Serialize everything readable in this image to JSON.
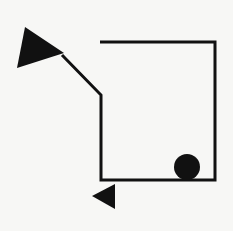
{
  "diagram": {
    "background": "#f7f7f5",
    "stroke_color": "#111111",
    "stroke_width": 3,
    "path": {
      "points": "100,42 215,42 215,180 101,180 101,95 62,55"
    },
    "arrowhead_large": {
      "points": "25,27 17,68 64,53"
    },
    "arrowhead_small": {
      "points": "92,196 115,184 115,209"
    },
    "dot": {
      "cx": 187,
      "cy": 167,
      "r": 13
    }
  }
}
